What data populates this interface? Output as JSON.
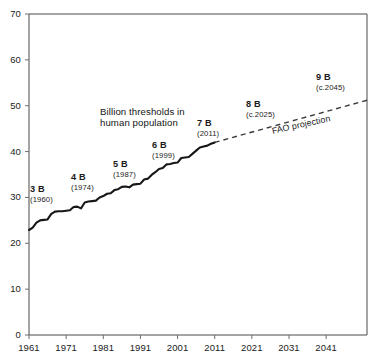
{
  "chart_data": {
    "type": "line",
    "title": "",
    "xlabel": "",
    "ylabel": "",
    "xlim": [
      1961,
      2052
    ],
    "ylim": [
      0,
      70
    ],
    "grid": false,
    "legend_position": "none",
    "x_ticks": [
      "1961",
      "1971",
      "1981",
      "1991",
      "2001",
      "2011",
      "2021",
      "2031",
      "2041"
    ],
    "x_tick_values": [
      1961,
      1971,
      1981,
      1991,
      2001,
      2011,
      2021,
      2031,
      2041
    ],
    "y_ticks": [
      "0",
      "10",
      "20",
      "30",
      "40",
      "50",
      "60",
      "70"
    ],
    "y_tick_values": [
      0,
      10,
      20,
      30,
      40,
      50,
      60,
      70
    ],
    "series": [
      {
        "name": "historical",
        "style": "solid",
        "x": [
          1961,
          1962,
          1963,
          1964,
          1965,
          1966,
          1967,
          1968,
          1969,
          1970,
          1971,
          1972,
          1973,
          1974,
          1975,
          1976,
          1977,
          1978,
          1979,
          1980,
          1981,
          1982,
          1983,
          1984,
          1985,
          1986,
          1987,
          1988,
          1989,
          1990,
          1991,
          1992,
          1993,
          1994,
          1995,
          1996,
          1997,
          1998,
          1999,
          2000,
          2001,
          2002,
          2003,
          2004,
          2005,
          2006,
          2007,
          2008,
          2009,
          2010,
          2011
        ],
        "values": [
          22.9,
          23.4,
          24.5,
          25.0,
          25.1,
          25.2,
          26.4,
          26.9,
          27.0,
          27.0,
          27.1,
          27.2,
          27.9,
          28.0,
          27.6,
          28.9,
          29.1,
          29.2,
          29.3,
          30.0,
          30.3,
          30.8,
          30.9,
          31.6,
          31.8,
          32.3,
          32.4,
          32.2,
          32.8,
          32.9,
          33.0,
          33.9,
          34.1,
          34.9,
          35.5,
          36.2,
          36.4,
          37.2,
          37.3,
          37.5,
          37.6,
          38.6,
          38.7,
          38.8,
          39.5,
          40.2,
          40.9,
          41.1,
          41.3,
          41.7,
          42.0
        ]
      },
      {
        "name": "FAO projection",
        "style": "dashed",
        "x": [
          2011,
          2052
        ],
        "values": [
          42.0,
          51.2
        ]
      }
    ],
    "annotations": [
      {
        "id": "threshold-3b",
        "big": "3 B",
        "year": "(1960)",
        "x_px": 30,
        "y_px": 185
      },
      {
        "id": "threshold-4b",
        "big": "4 B",
        "year": "(1974)",
        "x_px": 71,
        "y_px": 173
      },
      {
        "id": "threshold-5b",
        "big": "5 B",
        "year": "(1987)",
        "x_px": 113,
        "y_px": 160
      },
      {
        "id": "threshold-6b",
        "big": "6 B",
        "year": "(1999)",
        "x_px": 152,
        "y_px": 141
      },
      {
        "id": "threshold-7b",
        "big": "7 B",
        "year": "(2011)",
        "x_px": 197,
        "y_px": 119
      },
      {
        "id": "threshold-8b",
        "big": "8 B",
        "year": "(c.2025)",
        "x_px": 246,
        "y_px": 100
      },
      {
        "id": "threshold-9b",
        "big": "9 B",
        "year": "(c.2045)",
        "x_px": 316,
        "y_px": 73
      }
    ],
    "caption": {
      "line1": "Billion thresholds in",
      "line2": "human population"
    },
    "projection_label": "FAO projection"
  },
  "colors": {
    "series_line": "#171717",
    "projection_line": "#3a3a3a",
    "axis": "#4a4a4a",
    "text": "#1b1b1b",
    "background": "#ffffff"
  }
}
